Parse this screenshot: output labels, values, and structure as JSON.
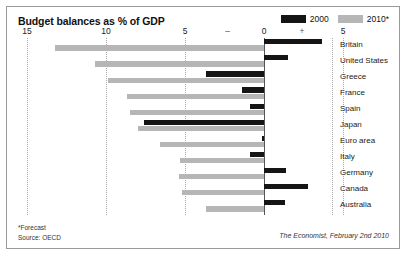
{
  "chart_data": {
    "type": "bar",
    "title": "Budget balances as % of GDP",
    "xlabel": "",
    "ylabel": "",
    "orientation": "horizontal",
    "grid": true,
    "legend_position": "top-right",
    "xlim": [
      -15,
      5
    ],
    "xticks": [
      -15,
      -10,
      -5,
      0,
      5
    ],
    "xtick_labels": [
      "15",
      "10",
      "5",
      "0",
      "5"
    ],
    "sign_markers": {
      "negative": "–",
      "positive": "+"
    },
    "categories": [
      "Britain",
      "United States",
      "Greece",
      "France",
      "Spain",
      "Japan",
      "Euro area",
      "Italy",
      "Germany",
      "Canada",
      "Australia"
    ],
    "series": [
      {
        "name": "2000",
        "color": "#151515",
        "values": [
          3.7,
          1.5,
          -3.7,
          -1.4,
          -0.9,
          -7.6,
          -0.1,
          -0.9,
          1.4,
          2.8,
          1.3
        ]
      },
      {
        "name": "2010*",
        "color": "#b6b6b6",
        "values": [
          -13.2,
          -10.7,
          -9.9,
          -8.7,
          -8.5,
          -8.0,
          -6.6,
          -5.3,
          -5.4,
          -5.2,
          -3.7
        ]
      }
    ],
    "annotations": {
      "forecast_note": "*Forecast",
      "source": "Source: OECD",
      "credit": "The Economist, February 2nd 2010"
    }
  },
  "legend": {
    "items": [
      {
        "label": "2000",
        "color": "#151515"
      },
      {
        "label": "2010*",
        "color": "#b6b6b6"
      }
    ]
  }
}
